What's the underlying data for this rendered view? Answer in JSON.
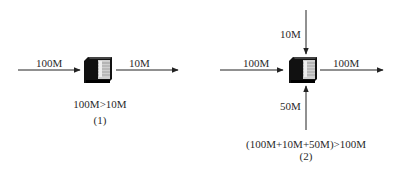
{
  "diagram1": {
    "input_label": "100M",
    "output_label": "10M",
    "caption": "100M>10M",
    "number": "(1)"
  },
  "diagram2": {
    "input_left_label": "100M",
    "input_top_label": "10M",
    "input_bottom_label": "50M",
    "output_label": "100M",
    "caption": "(100M+10M+50M)>100M",
    "number": "(2)"
  },
  "icons": {
    "device": "network-switch-icon"
  },
  "colors": {
    "line": "#222222",
    "device_dark": "#111111",
    "device_light": "#d9d9d9"
  }
}
